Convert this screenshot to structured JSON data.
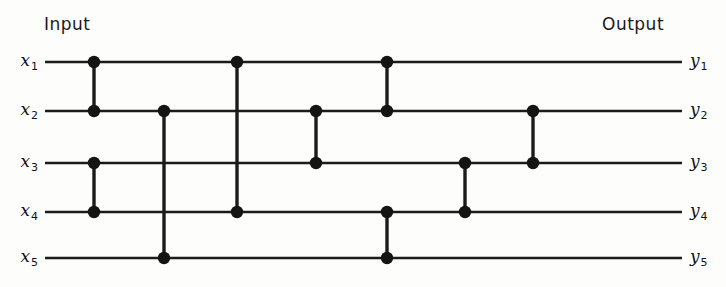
{
  "figure": {
    "title_left": "Input",
    "title_right": "Output",
    "background_color": "#fdfdfc",
    "line_color": "#1b1b1b",
    "node_color": "#141414"
  },
  "headers": {
    "input_label": "Input",
    "output_label": "Output"
  },
  "wires": [
    {
      "index": 1,
      "input_var": "x",
      "input_sub": "1",
      "output_var": "y",
      "output_sub": "1",
      "y": 62
    },
    {
      "index": 2,
      "input_var": "x",
      "input_sub": "2",
      "output_var": "y",
      "output_sub": "2",
      "y": 111
    },
    {
      "index": 3,
      "input_var": "x",
      "input_sub": "3",
      "output_var": "y",
      "output_sub": "3",
      "y": 163
    },
    {
      "index": 4,
      "input_var": "x",
      "input_sub": "4",
      "output_var": "y",
      "output_sub": "4",
      "y": 212
    },
    {
      "index": 5,
      "input_var": "x",
      "input_sub": "5",
      "output_var": "y",
      "output_sub": "5",
      "y": 258
    }
  ],
  "geometry": {
    "line_start_x": 45,
    "line_end_x": 682,
    "input_label_x": 38,
    "output_label_x": 690,
    "node_radius": 6.2
  },
  "comparators": [
    {
      "id": "c1",
      "x": 94,
      "top_wire": 1,
      "bottom_wire": 2
    },
    {
      "id": "c2",
      "x": 94,
      "top_wire": 3,
      "bottom_wire": 4
    },
    {
      "id": "c3",
      "x": 164,
      "top_wire": 2,
      "bottom_wire": 5
    },
    {
      "id": "c4",
      "x": 237,
      "top_wire": 1,
      "bottom_wire": 4
    },
    {
      "id": "c5",
      "x": 316,
      "top_wire": 2,
      "bottom_wire": 3
    },
    {
      "id": "c6",
      "x": 387,
      "top_wire": 1,
      "bottom_wire": 2
    },
    {
      "id": "c7",
      "x": 387,
      "top_wire": 4,
      "bottom_wire": 5
    },
    {
      "id": "c8",
      "x": 465,
      "top_wire": 3,
      "bottom_wire": 4
    },
    {
      "id": "c9",
      "x": 533,
      "top_wire": 2,
      "bottom_wire": 3
    }
  ],
  "chart_data": {
    "type": "diagram",
    "diagram_kind": "sorting-network",
    "title": "",
    "inputs": [
      "x1",
      "x2",
      "x3",
      "x4",
      "x5"
    ],
    "outputs": [
      "y1",
      "y2",
      "y3",
      "y4",
      "y5"
    ],
    "num_wires": 5,
    "num_comparators": 9,
    "comparator_pairs": [
      [
        1,
        2
      ],
      [
        3,
        4
      ],
      [
        2,
        5
      ],
      [
        1,
        4
      ],
      [
        2,
        3
      ],
      [
        1,
        2
      ],
      [
        4,
        5
      ],
      [
        3,
        4
      ],
      [
        2,
        3
      ]
    ],
    "stages": [
      {
        "stage": 1,
        "pairs": [
          [
            1,
            2
          ],
          [
            3,
            4
          ]
        ]
      },
      {
        "stage": 2,
        "pairs": [
          [
            2,
            5
          ]
        ]
      },
      {
        "stage": 3,
        "pairs": [
          [
            1,
            4
          ]
        ]
      },
      {
        "stage": 4,
        "pairs": [
          [
            2,
            3
          ]
        ]
      },
      {
        "stage": 5,
        "pairs": [
          [
            1,
            2
          ],
          [
            4,
            5
          ]
        ]
      },
      {
        "stage": 6,
        "pairs": [
          [
            3,
            4
          ]
        ]
      },
      {
        "stage": 7,
        "pairs": [
          [
            2,
            3
          ]
        ]
      }
    ]
  }
}
